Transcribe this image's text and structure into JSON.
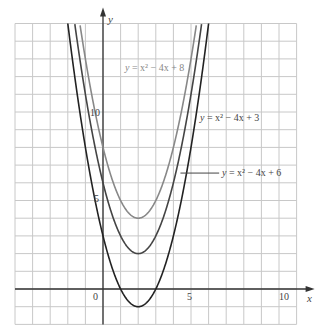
{
  "chart_data": {
    "type": "line",
    "title": "",
    "xlabel": "x",
    "ylabel": "y",
    "xlim": [
      -5,
      11
    ],
    "ylim": [
      -2,
      15
    ],
    "grid": true,
    "x_ticks": [
      0,
      5,
      10
    ],
    "y_ticks": [
      5,
      10
    ],
    "tick_labels": {
      "origin": "0",
      "x5": "5",
      "x10": "10",
      "y5": "5",
      "y10": "10"
    },
    "series": [
      {
        "name": "y = x² − 4x + 8",
        "a": 1,
        "b": -4,
        "c": 8,
        "vertex": [
          2,
          4
        ],
        "color": "#888888"
      },
      {
        "name": "y = x² − 4x + 6",
        "a": 1,
        "b": -4,
        "c": 6,
        "vertex": [
          2,
          2
        ],
        "color": "#444444"
      },
      {
        "name": "y = x² − 4x + 3",
        "a": 1,
        "b": -4,
        "c": 3,
        "vertex": [
          2,
          -1
        ],
        "color": "#222222"
      }
    ],
    "annotations": [
      {
        "text": "y = x² − 4x + 8",
        "at": [
          1.0,
          13.0
        ]
      },
      {
        "text": "y = x² − 4x + 3",
        "at": [
          5.5,
          10.0
        ]
      },
      {
        "text": "y = x² − 4x + 6",
        "at": [
          6.5,
          7.5
        ],
        "leader_line": true
      }
    ]
  },
  "labels": {
    "x_axis": "x",
    "y_axis": "y",
    "origin": "0",
    "x5": "5",
    "x10": "10",
    "y5": "5",
    "y10": "10",
    "curve8_prefix": "y",
    "curve8_eq": " = x² − 4x + 8",
    "curve3_prefix": "y",
    "curve3_eq": " = x² − 4x + 3",
    "curve6_prefix": "y",
    "curve6_eq": " = x² − 4x + 6"
  }
}
